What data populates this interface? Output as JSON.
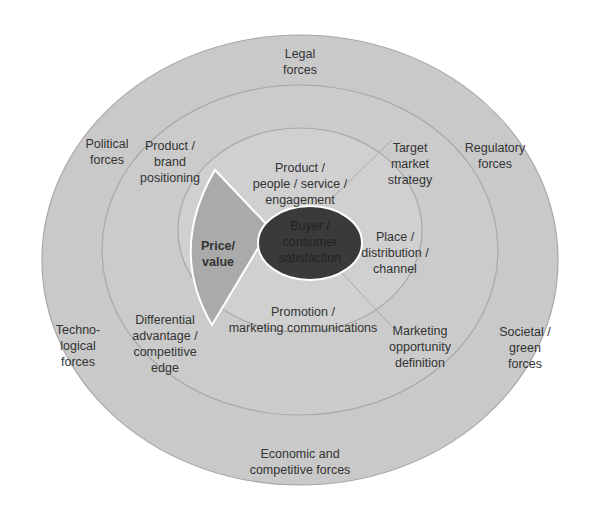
{
  "diagram": {
    "colors": {
      "background": "#ffffff",
      "outer_ring": "#c9c9c9",
      "middle_ring": "#cdcdcd",
      "inner_ring": "#d3d3d3",
      "price_segment": "#aaaaaa",
      "center": "#3a3a3a",
      "ring_stroke": "#a8a8a8",
      "segment_stroke": "#ffffff"
    },
    "center": {
      "label": "Buyer /\nconsumer\nsatisfaction"
    },
    "inner_ring": [
      {
        "id": "product",
        "label": "Product /\npeople / service /\nengagement"
      },
      {
        "id": "place",
        "label": "Place /\ndistribution /\nchannel"
      },
      {
        "id": "promotion",
        "label": "Promotion /\nmarketing communications"
      },
      {
        "id": "price",
        "label": "Price/\nvalue",
        "highlighted": true
      }
    ],
    "middle_ring": [
      {
        "id": "positioning",
        "label": "Product /\nbrand\npositioning"
      },
      {
        "id": "target",
        "label": "Target\nmarket\nstrategy"
      },
      {
        "id": "opportunity",
        "label": "Marketing\nopportunity\ndefinition"
      },
      {
        "id": "differential",
        "label": "Differential\nadvantage /\ncompetitive\nedge"
      }
    ],
    "outer_ring": [
      {
        "id": "legal",
        "label": "Legal\nforces"
      },
      {
        "id": "regulatory",
        "label": "Regulatory\nforces"
      },
      {
        "id": "societal",
        "label": "Societal /\ngreen\nforces"
      },
      {
        "id": "economic",
        "label": "Economic and\ncompetitive forces"
      },
      {
        "id": "technological",
        "label": "Techno-\nlogical\nforces"
      },
      {
        "id": "political",
        "label": "Political\nforces"
      }
    ]
  }
}
